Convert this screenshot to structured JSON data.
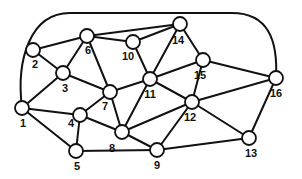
{
  "diagram": {
    "type": "undirected-graph",
    "colors": {
      "stroke": "#111111",
      "node_fill": "#ffffff",
      "background": "#ffffff"
    },
    "node_radius": 7,
    "nodes": [
      {
        "id": "1",
        "x": 22,
        "y": 108,
        "lx": 23,
        "ly": 127
      },
      {
        "id": "2",
        "x": 33,
        "y": 50,
        "lx": 35,
        "ly": 68
      },
      {
        "id": "3",
        "x": 63,
        "y": 73,
        "lx": 65,
        "ly": 92
      },
      {
        "id": "4",
        "x": 80,
        "y": 115,
        "lx": 71,
        "ly": 127
      },
      {
        "id": "5",
        "x": 76,
        "y": 151,
        "lx": 77,
        "ly": 170
      },
      {
        "id": "6",
        "x": 87,
        "y": 36,
        "lx": 88,
        "ly": 54
      },
      {
        "id": "7",
        "x": 110,
        "y": 92,
        "lx": 105,
        "ly": 110
      },
      {
        "id": "8",
        "x": 122,
        "y": 132,
        "lx": 112,
        "ly": 152
      },
      {
        "id": "9",
        "x": 157,
        "y": 150,
        "lx": 157,
        "ly": 169
      },
      {
        "id": "10",
        "x": 133,
        "y": 42,
        "lx": 128,
        "ly": 60
      },
      {
        "id": "11",
        "x": 150,
        "y": 79,
        "lx": 150,
        "ly": 98
      },
      {
        "id": "12",
        "x": 192,
        "y": 102,
        "lx": 190,
        "ly": 121
      },
      {
        "id": "13",
        "x": 249,
        "y": 138,
        "lx": 251,
        "ly": 157
      },
      {
        "id": "14",
        "x": 180,
        "y": 24,
        "lx": 178,
        "ly": 44
      },
      {
        "id": "15",
        "x": 203,
        "y": 60,
        "lx": 200,
        "ly": 79
      },
      {
        "id": "16",
        "x": 276,
        "y": 78,
        "lx": 276,
        "ly": 97
      }
    ],
    "edges": [
      [
        "1",
        "3"
      ],
      [
        "1",
        "4"
      ],
      [
        "1",
        "5"
      ],
      [
        "2",
        "3"
      ],
      [
        "2",
        "6"
      ],
      [
        "3",
        "6"
      ],
      [
        "3",
        "7"
      ],
      [
        "4",
        "5"
      ],
      [
        "4",
        "7"
      ],
      [
        "4",
        "8"
      ],
      [
        "5",
        "9"
      ],
      [
        "6",
        "7"
      ],
      [
        "6",
        "10"
      ],
      [
        "6",
        "14"
      ],
      [
        "7",
        "8"
      ],
      [
        "7",
        "11"
      ],
      [
        "8",
        "9"
      ],
      [
        "8",
        "11"
      ],
      [
        "8",
        "12"
      ],
      [
        "9",
        "12"
      ],
      [
        "9",
        "13"
      ],
      [
        "10",
        "11"
      ],
      [
        "10",
        "14"
      ],
      [
        "11",
        "12"
      ],
      [
        "11",
        "14"
      ],
      [
        "11",
        "15"
      ],
      [
        "12",
        "13"
      ],
      [
        "12",
        "15"
      ],
      [
        "12",
        "16"
      ],
      [
        "13",
        "16"
      ],
      [
        "14",
        "15"
      ],
      [
        "15",
        "16"
      ]
    ],
    "outer_edge": {
      "from": "1",
      "to": "16",
      "path": "M 22 108 C 16 60, 30 13, 70 13 L 232 13 C 268 13, 278 40, 276 78"
    }
  }
}
